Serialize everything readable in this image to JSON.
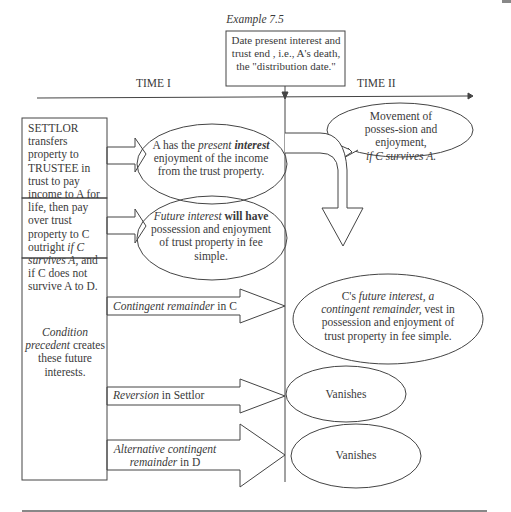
{
  "title": "Example 7.5",
  "distribution_box": "Date present interest and trust end , i.e., A's death, the \"distribution date.\"",
  "timeline": {
    "left_label": "TIME  I",
    "right_label": "TIME II"
  },
  "settlor_box": {
    "p1": "SETTLOR transfers property to TRUSTEE in trust to pay income to A for life, then pay over trust property to C outright ",
    "p1_italic": "if C survives A,",
    "p1_end": " and if C does not survive A to D."
  },
  "condition_box": {
    "italic": "Condition precedent",
    "rest": "creates these future interests."
  },
  "ellipses": {
    "present": {
      "a": "A has the ",
      "b_i": "present",
      "c_bi": "interest",
      "d": " enjoyment of the income from the trust property."
    },
    "future": {
      "a_i": "Future interest",
      "b_b": " will have",
      "c": " possession and enjoyment of trust property in fee simple."
    },
    "movement": {
      "a": "Movement of posses-sion and enjoyment,",
      "b_i": "if C survives A."
    },
    "vest": {
      "a": "C's ",
      "b_i": "future interest, a contingent remainder,",
      "c": " vest in possession and enjoyment of trust property in fee simple."
    },
    "vanish1": "Vanishes",
    "vanish2": "Vanishes"
  },
  "arrows": {
    "contingent": {
      "italic": "Contingent remainder",
      "rest": " in C"
    },
    "reversion": {
      "italic": "Reversion",
      "rest": " in Settlor"
    },
    "alternative": {
      "italic": "Alternative contingent remainder",
      "rest": " in D"
    }
  }
}
